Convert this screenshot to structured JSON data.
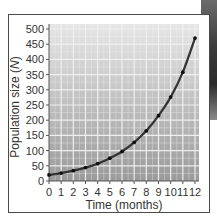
{
  "chart_data": {
    "type": "line",
    "title": "",
    "xlabel": "Time (months)",
    "ylabel": "Population size (N)",
    "ylabel_main": "Population size (",
    "ylabel_var": "N",
    "ylabel_end": ")",
    "x": [
      0,
      1,
      2,
      3,
      4,
      5,
      6,
      7,
      8,
      9,
      10,
      11,
      12
    ],
    "series": [
      {
        "name": "Population",
        "values": [
          20,
          26,
          34,
          44,
          57,
          75,
          97,
          127,
          165,
          215,
          276,
          358,
          470
        ]
      }
    ],
    "xlim": [
      0,
      12
    ],
    "ylim": [
      0,
      500
    ],
    "xticks": [
      "0",
      "1",
      "2",
      "3",
      "4",
      "5",
      "6",
      "7",
      "8",
      "9",
      "10",
      "11",
      "12"
    ],
    "yticks": [
      "0",
      "50",
      "100",
      "150",
      "200",
      "250",
      "300",
      "350",
      "400",
      "450",
      "500"
    ],
    "grid": true,
    "legend": "none"
  },
  "colors": {
    "plot_bg_top": "#e4e4e4",
    "plot_bg_bottom": "#9c9c9c",
    "grid": "#f2f2f2",
    "curve": "#333333",
    "points": "#111111",
    "axis": "#555555"
  }
}
